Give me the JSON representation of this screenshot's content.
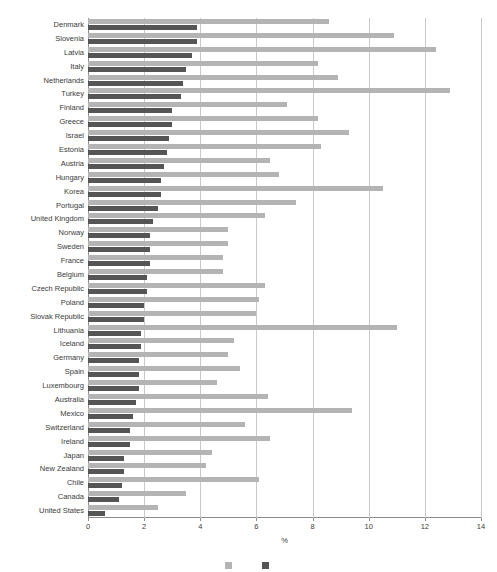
{
  "chart_data": {
    "type": "bar",
    "orientation": "horizontal",
    "title": "",
    "subtitle": "",
    "xlabel": "%",
    "ylabel": "",
    "xlim": [
      0,
      14
    ],
    "xticks": [
      0,
      2,
      4,
      6,
      8,
      10,
      12,
      14
    ],
    "xtick_labels": [
      "0",
      "2",
      "4",
      "6",
      "8",
      "10",
      "12",
      "14"
    ],
    "grid": true,
    "grid_axis": "x",
    "legend_position": "bottom",
    "colors": {
      "series_light": "#b4b4b4",
      "series_dark": "#555555",
      "axis": "#8c8c8c",
      "gridline": "#c9c9c9",
      "text": "#3b3b3b",
      "background": "#ffffff"
    },
    "categories": [
      "Denmark",
      "Slovenia",
      "Latvia",
      "Italy",
      "Netherlands",
      "Turkey",
      "Finland",
      "Greece",
      "Israel",
      "Estonia",
      "Austria",
      "Hungary",
      "Korea",
      "Portugal",
      "United Kingdom",
      "Norway",
      "Sweden",
      "France",
      "Belgium",
      "Czech Republic",
      "Poland",
      "Slovak Republic",
      "Lithuania",
      "Iceland",
      "Germany",
      "Spain",
      "Luxembourg",
      "Australia",
      "Mexico",
      "Switzerland",
      "Ireland",
      "Japan",
      "New Zealand",
      "Chile",
      "Canada",
      "United States"
    ],
    "series": [
      {
        "name": "Series light",
        "color": "#b4b4b4",
        "values": [
          8.6,
          10.9,
          12.4,
          8.2,
          8.9,
          12.9,
          7.1,
          8.2,
          9.3,
          8.3,
          6.5,
          6.8,
          10.5,
          7.4,
          6.3,
          5.0,
          5.0,
          4.8,
          4.8,
          6.3,
          6.1,
          6.0,
          11.0,
          5.2,
          5.0,
          5.4,
          4.6,
          6.4,
          9.4,
          5.6,
          6.5,
          4.4,
          4.2,
          6.1,
          3.5,
          2.5
        ]
      },
      {
        "name": "Series dark",
        "color": "#555555",
        "values": [
          3.9,
          3.9,
          3.7,
          3.5,
          3.4,
          3.3,
          3.0,
          3.0,
          2.9,
          2.8,
          2.7,
          2.6,
          2.6,
          2.5,
          2.3,
          2.2,
          2.2,
          2.2,
          2.1,
          2.1,
          2.0,
          2.0,
          1.9,
          1.9,
          1.8,
          1.8,
          1.8,
          1.7,
          1.6,
          1.5,
          1.5,
          1.3,
          1.3,
          1.2,
          1.1,
          0.6
        ]
      }
    ]
  },
  "axis": {
    "x_title": "%"
  },
  "legend": {
    "items": [
      {
        "label": "",
        "swatch": "light"
      },
      {
        "label": "",
        "swatch": "dark"
      }
    ]
  }
}
